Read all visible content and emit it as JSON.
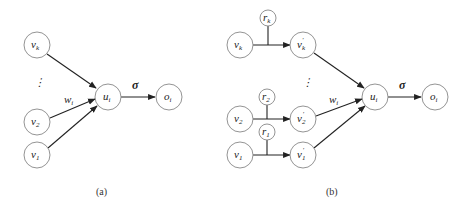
{
  "diagram_a": {
    "caption": "(a)",
    "nodes": {
      "vk": {
        "base": "v",
        "sub": "k"
      },
      "v2": {
        "base": "v",
        "sub": "2"
      },
      "v1": {
        "base": "v",
        "sub": "1"
      },
      "ui": {
        "base": "u",
        "sub": "i"
      },
      "oi": {
        "base": "o",
        "sub": "i"
      }
    },
    "weight_label": {
      "base": "w",
      "sub": "i"
    },
    "activation_label": "σ",
    "ellipsis": "⋮"
  },
  "diagram_b": {
    "caption": "(b)",
    "nodes": {
      "rk": {
        "base": "r",
        "sub": "k"
      },
      "vk": {
        "base": "v",
        "sub": "k"
      },
      "vk_prime": {
        "base": "v",
        "sub": "k",
        "prime": "′"
      },
      "r2": {
        "base": "r",
        "sub": "2"
      },
      "v2": {
        "base": "v",
        "sub": "2"
      },
      "v2_prime": {
        "base": "v",
        "sub": "2",
        "prime": "′"
      },
      "r1": {
        "base": "r",
        "sub": "1"
      },
      "v1": {
        "base": "v",
        "sub": "1"
      },
      "v1_prime": {
        "base": "v",
        "sub": "1",
        "prime": "′"
      },
      "ui": {
        "base": "u",
        "sub": "i"
      },
      "oi": {
        "base": "o",
        "sub": "i"
      }
    },
    "weight_label": {
      "base": "w",
      "sub": "i"
    },
    "activation_label": "σ",
    "ellipsis": "⋮"
  }
}
